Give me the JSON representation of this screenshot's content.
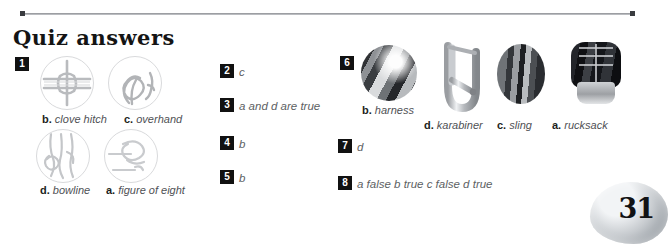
{
  "page": {
    "title": "Quiz answers",
    "page_number": "31",
    "background_color": "#ffffff",
    "rule_color": "#8d8f93",
    "badge_color": "#111111",
    "answer_text_color": "#5d5f63"
  },
  "question_1": {
    "number": "1",
    "answers": [
      {
        "letter": "b.",
        "name": "clove hitch",
        "icon": "clove-hitch-knot-icon"
      },
      {
        "letter": "c.",
        "name": "overhand",
        "icon": "overhand-knot-icon"
      },
      {
        "letter": "d.",
        "name": "bowline",
        "icon": "bowline-knot-icon"
      },
      {
        "letter": "a.",
        "name": "figure of eight",
        "icon": "figure-of-eight-knot-icon"
      }
    ]
  },
  "middle_column": [
    {
      "number": "2",
      "answer": "c"
    },
    {
      "number": "3",
      "answer": "a and d are true"
    },
    {
      "number": "4",
      "answer": "b"
    },
    {
      "number": "5",
      "answer": "b"
    }
  ],
  "question_6": {
    "number": "6",
    "answers": [
      {
        "letter": "b.",
        "name": "harness",
        "icon": "harness-photo"
      },
      {
        "letter": "d.",
        "name": "karabiner",
        "icon": "karabiner-photo"
      },
      {
        "letter": "c.",
        "name": "sling",
        "icon": "sling-photo"
      },
      {
        "letter": "a.",
        "name": "rucksack",
        "icon": "rucksack-photo"
      }
    ]
  },
  "question_7": {
    "number": "7",
    "answer": "d"
  },
  "question_8": {
    "number": "8",
    "answer": "a false   b true   c false   d true"
  }
}
